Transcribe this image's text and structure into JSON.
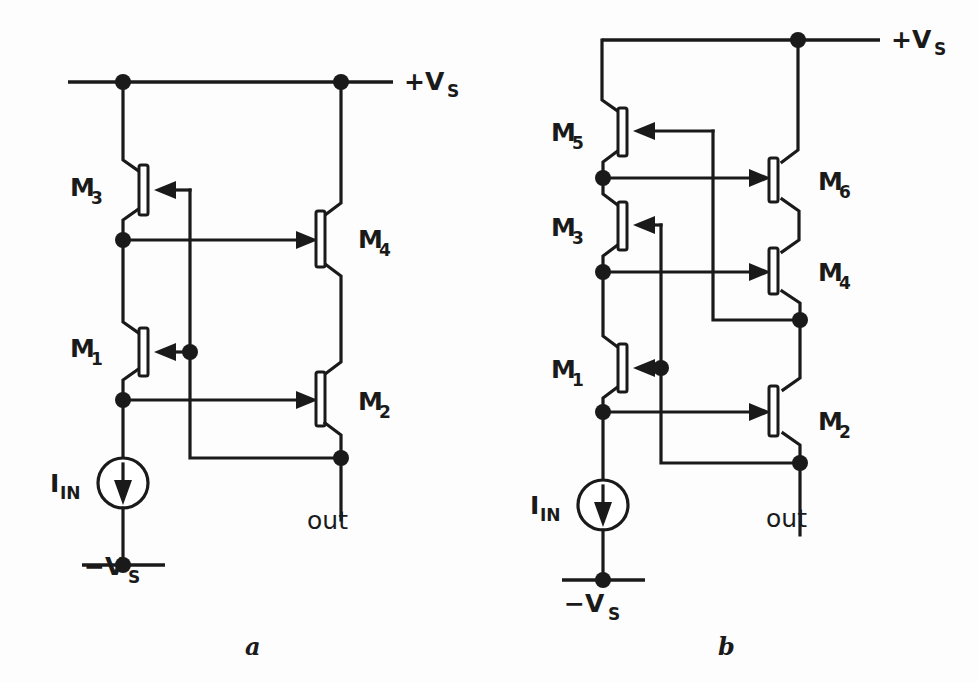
{
  "figure": {
    "kind": "circuit-schematic",
    "background_color": "#fdfdfd",
    "ink_color": "#1a1a1a",
    "subfigures": [
      {
        "caption": "a",
        "title": "Cascode current mirror (a)"
      },
      {
        "caption": "b",
        "title": "Cascode current mirror with extra level shift (b)"
      }
    ]
  },
  "circuit_a": {
    "caption": "a",
    "rail_positive": "+V",
    "rail_positive_sub": "S",
    "rail_negative": "−V",
    "rail_negative_sub": "S",
    "source_label": "I",
    "source_label_sub": "IN",
    "output_label": "out",
    "transistors": [
      {
        "name": "M",
        "sub": "1",
        "label_x": 70,
        "label_y": 357
      },
      {
        "name": "M",
        "sub": "2",
        "label_x": 358,
        "label_y": 410
      },
      {
        "name": "M",
        "sub": "3",
        "label_x": 70,
        "label_y": 196
      },
      {
        "name": "M",
        "sub": "4",
        "label_x": 358,
        "label_y": 248
      }
    ]
  },
  "circuit_b": {
    "caption": "b",
    "rail_positive": "+V",
    "rail_positive_sub": "S",
    "rail_negative": "−V",
    "rail_negative_sub": "S",
    "source_label": "I",
    "source_label_sub": "IN",
    "output_label": "out",
    "transistors": [
      {
        "name": "M",
        "sub": "1",
        "label_x": 551,
        "label_y": 378
      },
      {
        "name": "M",
        "sub": "2",
        "label_x": 818,
        "label_y": 430
      },
      {
        "name": "M",
        "sub": "3",
        "label_x": 551,
        "label_y": 236
      },
      {
        "name": "M",
        "sub": "4",
        "label_x": 818,
        "label_y": 281
      },
      {
        "name": "M",
        "sub": "5",
        "label_x": 551,
        "label_y": 141
      },
      {
        "name": "M",
        "sub": "6",
        "label_x": 818,
        "label_y": 190
      }
    ]
  }
}
